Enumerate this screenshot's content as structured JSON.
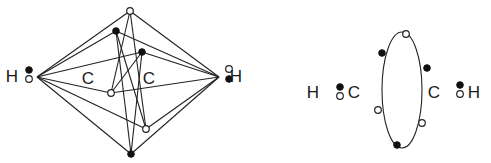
{
  "diagram": {
    "left_structure": {
      "labels": [
        {
          "text": "H",
          "x": 12,
          "y": 82
        },
        {
          "text": "C",
          "x": 88,
          "y": 84
        },
        {
          "text": "C",
          "x": 149,
          "y": 84
        },
        {
          "text": "H",
          "x": 236,
          "y": 82
        }
      ],
      "vertices": {
        "left": [
          37,
          77
        ],
        "right": [
          219,
          77
        ],
        "top": [
          130,
          11
        ],
        "bottom": [
          131,
          154
        ],
        "a": [
          116,
          31
        ],
        "b": [
          142,
          52
        ],
        "c": [
          111,
          93
        ],
        "d": [
          146,
          129
        ]
      },
      "electrons": [
        {
          "type": "filled",
          "x": 29,
          "y": 70
        },
        {
          "type": "open",
          "x": 29,
          "y": 79
        },
        {
          "type": "open",
          "x": 130,
          "y": 11
        },
        {
          "type": "filled",
          "x": 116,
          "y": 31
        },
        {
          "type": "filled",
          "x": 142,
          "y": 52
        },
        {
          "type": "open",
          "x": 111,
          "y": 93
        },
        {
          "type": "open",
          "x": 146,
          "y": 129
        },
        {
          "type": "filled",
          "x": 131,
          "y": 154
        },
        {
          "type": "open",
          "x": 229,
          "y": 69
        },
        {
          "type": "filled",
          "x": 229,
          "y": 79
        }
      ]
    },
    "right_structure": {
      "labels": [
        {
          "text": "H",
          "x": 313,
          "y": 98
        },
        {
          "text": "C",
          "x": 354,
          "y": 98
        },
        {
          "text": "C",
          "x": 434,
          "y": 98
        },
        {
          "text": "H",
          "x": 474,
          "y": 98
        }
      ],
      "ellipse": {
        "cx": 402,
        "cy": 90,
        "rx": 20,
        "ry": 58
      },
      "electrons": [
        {
          "type": "filled",
          "x": 340,
          "y": 87
        },
        {
          "type": "open",
          "x": 340,
          "y": 96
        },
        {
          "type": "open",
          "x": 406,
          "y": 34
        },
        {
          "type": "filled",
          "x": 382,
          "y": 53
        },
        {
          "type": "filled",
          "x": 427,
          "y": 68
        },
        {
          "type": "open",
          "x": 378,
          "y": 110
        },
        {
          "type": "open",
          "x": 422,
          "y": 123
        },
        {
          "type": "filled",
          "x": 397,
          "y": 145
        },
        {
          "type": "filled",
          "x": 460,
          "y": 85
        },
        {
          "type": "open",
          "x": 460,
          "y": 94
        }
      ]
    }
  }
}
